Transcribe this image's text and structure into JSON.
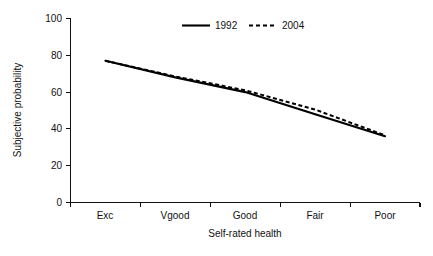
{
  "chart_data": {
    "type": "line",
    "title": "",
    "xlabel": "Self-rated health",
    "ylabel": "Subjective probability",
    "categories": [
      "Exc",
      "Vgood",
      "Good",
      "Fair",
      "Poor"
    ],
    "ylim": [
      0,
      100
    ],
    "yticks": [
      0,
      20,
      40,
      60,
      80,
      100
    ],
    "ytick_labels": [
      "0",
      "20",
      "40",
      "60",
      "80",
      "100"
    ],
    "grid": false,
    "legend_position": "top-center",
    "series": [
      {
        "name": "1992",
        "style": "solid",
        "color": "#000000",
        "values": [
          77,
          68,
          60,
          48,
          36
        ]
      },
      {
        "name": "2004",
        "style": "dashed",
        "color": "#000000",
        "values": [
          77,
          68.5,
          61,
          50.5,
          36.5
        ]
      }
    ]
  },
  "axes": {
    "y_title": "Subjective probability",
    "x_title": "Self-rated health"
  },
  "legend": {
    "entries": [
      {
        "label": "1992",
        "style": "solid"
      },
      {
        "label": "2004",
        "style": "dashed"
      }
    ]
  }
}
